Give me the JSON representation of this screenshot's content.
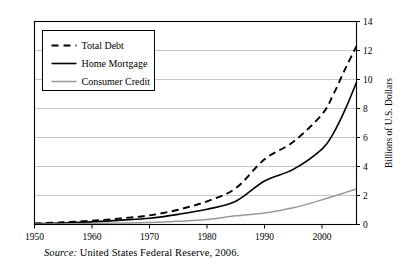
{
  "chart_data": {
    "type": "line",
    "title": "",
    "xlabel": "",
    "ylabel": "Billions of U.S. Dollars",
    "xlim": [
      1950,
      2006
    ],
    "ylim": [
      0,
      14
    ],
    "xticks": [
      1950,
      1960,
      1970,
      1980,
      1990,
      2000
    ],
    "yticks": [
      0,
      2,
      4,
      6,
      8,
      10,
      12,
      14
    ],
    "grid": "horizontal",
    "legend_position": "top-left",
    "x": [
      1950,
      1955,
      1960,
      1965,
      1970,
      1975,
      1980,
      1985,
      1990,
      1995,
      2000,
      2002,
      2004,
      2006
    ],
    "series": [
      {
        "name": "Total Debt",
        "style": "dashed",
        "color": "#000000",
        "values": [
          0.07,
          0.15,
          0.26,
          0.42,
          0.63,
          1.02,
          1.6,
          2.5,
          4.5,
          5.7,
          7.6,
          9.0,
          10.7,
          12.3
        ]
      },
      {
        "name": "Home Mortgage",
        "style": "solid",
        "color": "#000000",
        "values": [
          0.05,
          0.1,
          0.18,
          0.3,
          0.43,
          0.7,
          1.05,
          1.6,
          3.0,
          3.8,
          5.2,
          6.3,
          7.9,
          9.8
        ]
      },
      {
        "name": "Consumer Credit",
        "style": "solid",
        "color": "#999999",
        "values": [
          0.02,
          0.04,
          0.07,
          0.1,
          0.14,
          0.22,
          0.35,
          0.6,
          0.8,
          1.15,
          1.7,
          1.95,
          2.2,
          2.45
        ]
      }
    ]
  },
  "source": {
    "label": "Source:",
    "text": "United States Federal Reserve, 2006."
  }
}
